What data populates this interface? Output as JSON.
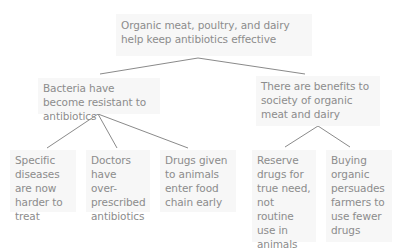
{
  "diagram": {
    "type": "argument-tree",
    "root": {
      "text": "Organic meat, poultry, and dairy help keep antibiotics effective"
    },
    "reasons": [
      {
        "text": "Bacteria have become resistant to antibiotics",
        "supports": [
          {
            "text": "Specific diseases are now harder to treat"
          },
          {
            "text": "Doctors have over-prescribed antibiotics"
          },
          {
            "text": "Drugs given to animals enter food chain early"
          }
        ]
      },
      {
        "text": "There are benefits to society of organic meat and dairy",
        "supports": [
          {
            "text": "Reserve drugs for true need, not routine use in animals"
          },
          {
            "text": "Buying organic persuades farmers to use fewer drugs"
          }
        ]
      }
    ],
    "colors": {
      "text": "#8c8c8c",
      "box_background": "#f7f7f7",
      "connector": "#8a8a8a",
      "page_background": "#ffffff"
    }
  }
}
